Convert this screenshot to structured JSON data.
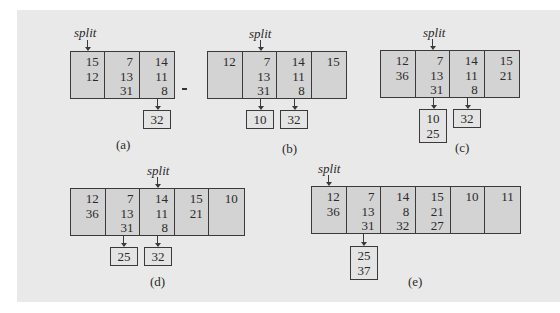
{
  "split_label": "split",
  "figures": {
    "a": {
      "caption": "(a)",
      "cells": [
        [
          "15",
          "12"
        ],
        [
          "7",
          "13",
          "31"
        ],
        [
          "14",
          "11",
          "8"
        ]
      ],
      "split_index": 0,
      "overflow": [
        {
          "cell_index": 2,
          "values": [
            "32"
          ]
        }
      ]
    },
    "b": {
      "caption": "(b)",
      "cells": [
        [
          "12"
        ],
        [
          "7",
          "13",
          "31"
        ],
        [
          "14",
          "11",
          "8"
        ],
        [
          "15"
        ]
      ],
      "split_index": 1,
      "overflow": [
        {
          "cell_index": 1,
          "values": [
            "10"
          ]
        },
        {
          "cell_index": 2,
          "values": [
            "32"
          ]
        }
      ]
    },
    "c": {
      "caption": "(c)",
      "cells": [
        [
          "12",
          "36"
        ],
        [
          "7",
          "13",
          "31"
        ],
        [
          "14",
          "11",
          "8"
        ],
        [
          "15",
          "21"
        ]
      ],
      "split_index": 1,
      "overflow": [
        {
          "cell_index": 1,
          "values": [
            "10",
            "25"
          ]
        },
        {
          "cell_index": 2,
          "values": [
            "32"
          ]
        }
      ]
    },
    "d": {
      "caption": "(d)",
      "cells": [
        [
          "12",
          "36"
        ],
        [
          "7",
          "13",
          "31"
        ],
        [
          "14",
          "11",
          "8"
        ],
        [
          "15",
          "21"
        ],
        [
          "10"
        ]
      ],
      "split_index": 2,
      "overflow": [
        {
          "cell_index": 1,
          "values": [
            "25"
          ]
        },
        {
          "cell_index": 2,
          "values": [
            "32"
          ]
        }
      ]
    },
    "e": {
      "caption": "(e)",
      "cells": [
        [
          "12",
          "36"
        ],
        [
          "7",
          "13",
          "31"
        ],
        [
          "14",
          "8",
          "32"
        ],
        [
          "15",
          "21",
          "27"
        ],
        [
          "10"
        ],
        [
          "11"
        ]
      ],
      "split_index": 0,
      "overflow": [
        {
          "cell_index": 1,
          "values": [
            "25",
            "37"
          ]
        }
      ]
    }
  }
}
